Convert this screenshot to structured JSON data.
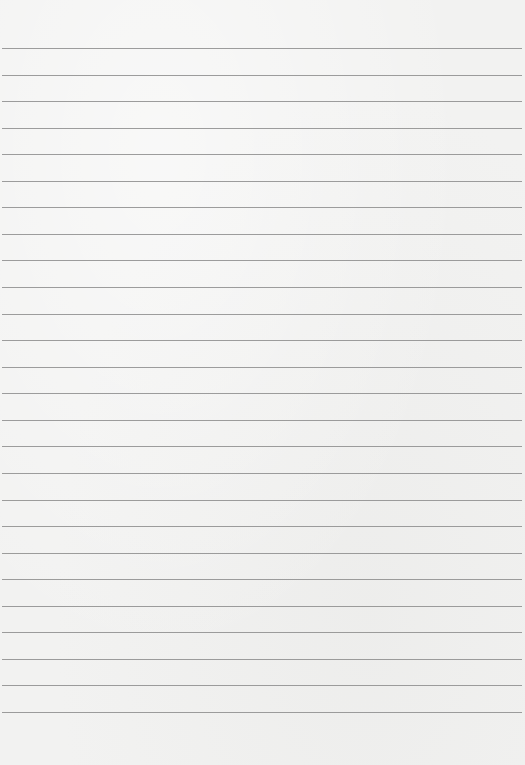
{
  "page": {
    "type": "lined-paper",
    "background_color": "#f2f2f1",
    "line_color": "#8c8c8c",
    "line_count": 26,
    "first_line_y": 48,
    "line_spacing": 26.56,
    "line_left": 2,
    "line_width": 520
  }
}
